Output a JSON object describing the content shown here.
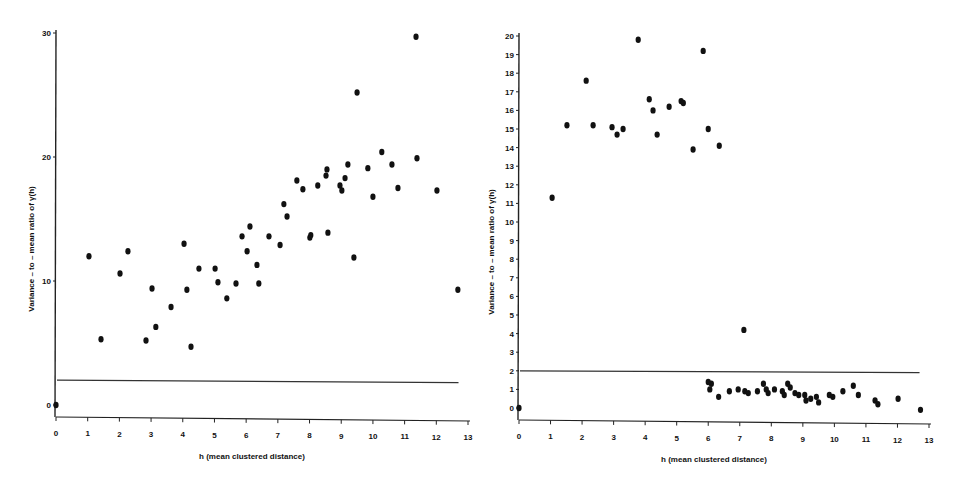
{
  "chart_data": [
    {
      "type": "scatter",
      "title": "",
      "xlabel": "h (mean clustered distance)",
      "ylabel": "Variance – to – mean ratio of γ(h)",
      "xlim": [
        0,
        13
      ],
      "ylim": [
        0,
        30
      ],
      "x_ticks": [
        "0",
        "1",
        "2",
        "3",
        "4",
        "5",
        "6",
        "7",
        "8",
        "9",
        "10",
        "11",
        "12",
        "13"
      ],
      "y_ticks": [
        "0",
        "10",
        "20",
        "30"
      ],
      "grid": false,
      "legend": null,
      "reference_line": {
        "y_start": 2.0,
        "y_end": 1.8,
        "x_start": 0,
        "x_end": 12.7
      },
      "series": [
        {
          "name": "points",
          "x": [
            0,
            1.04,
            1.42,
            2.02,
            2.27,
            2.84,
            3.03,
            3.15,
            3.63,
            4.04,
            4.13,
            4.26,
            4.51,
            5.02,
            5.11,
            5.39,
            5.68,
            5.87,
            6.03,
            6.12,
            6.34,
            6.4,
            6.72,
            7.07,
            7.19,
            7.29,
            7.6,
            7.79,
            8.01,
            8.04,
            8.26,
            8.52,
            8.55,
            8.58,
            8.96,
            9.02,
            9.12,
            9.21,
            9.4,
            9.5,
            9.84,
            10.0,
            10.28,
            10.6,
            10.79,
            11.36,
            11.39,
            12.02,
            12.68
          ],
          "y": [
            0,
            12.0,
            5.3,
            10.6,
            12.4,
            5.2,
            9.4,
            6.3,
            7.9,
            13.0,
            9.3,
            4.7,
            11.0,
            11.0,
            9.9,
            8.6,
            9.8,
            13.6,
            12.4,
            14.4,
            11.3,
            9.8,
            13.6,
            12.9,
            16.2,
            15.2,
            18.1,
            17.4,
            13.5,
            13.7,
            17.7,
            18.5,
            19.0,
            13.9,
            17.7,
            17.3,
            18.3,
            19.4,
            11.9,
            25.2,
            19.1,
            16.8,
            20.4,
            19.4,
            17.5,
            29.7,
            19.9,
            17.3,
            9.3
          ]
        }
      ]
    },
    {
      "type": "scatter",
      "title": "",
      "xlabel": "h (mean clustered distance)",
      "ylabel": "Variance – to – mean ratio of γ(h)",
      "xlim": [
        0,
        13
      ],
      "ylim": [
        0,
        20
      ],
      "x_ticks": [
        "0",
        "1",
        "2",
        "3",
        "4",
        "5",
        "6",
        "7",
        "8",
        "9",
        "10",
        "11",
        "12",
        "13"
      ],
      "y_ticks": [
        "0",
        "1",
        "2",
        "3",
        "4",
        "5",
        "6",
        "7",
        "8",
        "9",
        "10",
        "11",
        "12",
        "13",
        "14",
        "15",
        "16",
        "17",
        "18",
        "19",
        "20"
      ],
      "grid": false,
      "legend": null,
      "reference_line": {
        "y_start": 2.0,
        "y_end": 1.9,
        "x_start": 0,
        "x_end": 12.7
      },
      "series": [
        {
          "name": "points",
          "x": [
            0,
            1.05,
            1.52,
            2.13,
            2.35,
            2.95,
            3.11,
            3.3,
            3.78,
            4.13,
            4.25,
            4.38,
            4.76,
            5.14,
            5.21,
            5.52,
            5.84,
            6.0,
            6.1,
            6.35,
            7.13,
            6.0,
            6.05,
            6.33,
            6.67,
            6.95,
            7.16,
            7.27,
            7.56,
            7.75,
            7.84,
            7.9,
            8.1,
            8.35,
            8.41,
            8.52,
            8.6,
            8.75,
            8.87,
            9.06,
            9.1,
            9.25,
            9.43,
            9.5,
            9.84,
            9.95,
            10.27,
            10.6,
            10.76,
            11.29,
            11.38,
            12.02,
            12.73
          ],
          "y": [
            0,
            11.3,
            15.2,
            17.6,
            15.2,
            15.1,
            14.7,
            15.0,
            19.8,
            16.6,
            16.0,
            14.7,
            16.2,
            16.5,
            16.4,
            13.9,
            19.2,
            15.0,
            1.3,
            14.1,
            4.2,
            1.4,
            1.0,
            0.6,
            0.9,
            1.0,
            0.9,
            0.8,
            0.9,
            1.3,
            1.0,
            0.8,
            1.0,
            0.9,
            0.7,
            1.3,
            1.1,
            0.8,
            0.7,
            0.7,
            0.4,
            0.5,
            0.6,
            0.3,
            0.7,
            0.6,
            0.9,
            1.2,
            0.7,
            0.4,
            0.2,
            0.5,
            -0.1
          ]
        }
      ]
    }
  ],
  "panels": {
    "left": {
      "x_label": "h (mean clustered distance)",
      "y_label": "Variance – to – mean ratio of γ(h)"
    },
    "right": {
      "x_label": "h (mean clustered distance)",
      "y_label": "Variance – to – mean ratio of γ(h)"
    }
  }
}
